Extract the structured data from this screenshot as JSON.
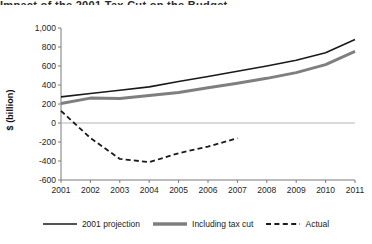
{
  "figure": {
    "title_remnant": "Impact of the 2001 Tax Cut on the Budget",
    "background_color": "#ffffff"
  },
  "axes": {
    "y_title": "$ (billion)",
    "y_ticks": [
      "1,000",
      "800",
      "600",
      "400",
      "200",
      "0",
      "-200",
      "-400",
      "-600"
    ],
    "x_ticks": [
      "2001",
      "2002",
      "2003",
      "2004",
      "2005",
      "2006",
      "2007",
      "2008",
      "2009",
      "2010",
      "2011"
    ]
  },
  "legend": {
    "items": [
      {
        "label": "2001 projection",
        "style": "solid-thin",
        "color": "#1a1a1a"
      },
      {
        "label": "Including tax cut",
        "style": "solid-thick",
        "color": "#7f7f7f"
      },
      {
        "label": "Actual",
        "style": "dashed",
        "color": "#1a1a1a"
      }
    ]
  },
  "chart_data": {
    "type": "line",
    "title": "Impact of the 2001 Tax Cut on the Budget",
    "xlabel": "",
    "ylabel": "$ (billion)",
    "x": [
      2001,
      2002,
      2003,
      2004,
      2005,
      2006,
      2007,
      2008,
      2009,
      2010,
      2011
    ],
    "xlim": [
      2001,
      2011
    ],
    "ylim": [
      -600,
      1000
    ],
    "ytick_step": 200,
    "grid": false,
    "legend_position": "bottom",
    "series": [
      {
        "name": "2001 projection",
        "color": "#1a1a1a",
        "style": "solid",
        "width": 1.6,
        "values": [
          275,
          310,
          345,
          380,
          437,
          490,
          545,
          600,
          660,
          740,
          880
        ]
      },
      {
        "name": "Including tax cut",
        "color": "#7f7f7f",
        "style": "solid",
        "width": 3.0,
        "values": [
          205,
          262,
          258,
          290,
          322,
          372,
          418,
          470,
          530,
          615,
          755
        ]
      },
      {
        "name": "Actual",
        "color": "#1a1a1a",
        "style": "dashed",
        "width": 1.8,
        "values": [
          128,
          -158,
          -378,
          -412,
          -318,
          -248,
          -160,
          null,
          null,
          null,
          null
        ]
      }
    ]
  }
}
